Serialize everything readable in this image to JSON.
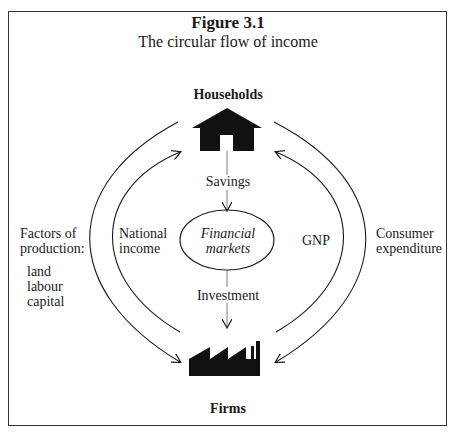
{
  "figure": {
    "number": "Figure 3.1",
    "title": "The circular flow of income"
  },
  "nodes": {
    "households": {
      "label": "Households",
      "icon": "house-icon"
    },
    "firms": {
      "label": "Firms",
      "icon": "factory-icon"
    },
    "financial_markets": {
      "line1": "Financial",
      "line2": "markets"
    }
  },
  "flows": {
    "savings": "Savings",
    "investment": "Investment",
    "national_income": {
      "line1": "National",
      "line2": "income"
    },
    "gnp": "GNP",
    "consumer_expenditure": {
      "line1": "Consumer",
      "line2": "expenditure"
    },
    "factors_of_production": {
      "line1": "Factors of",
      "line2": "production:",
      "items": [
        "land",
        "labour",
        "capital"
      ]
    }
  },
  "colors": {
    "ink": "#1a1a1a",
    "frame": "#333333",
    "background": "#ffffff"
  }
}
